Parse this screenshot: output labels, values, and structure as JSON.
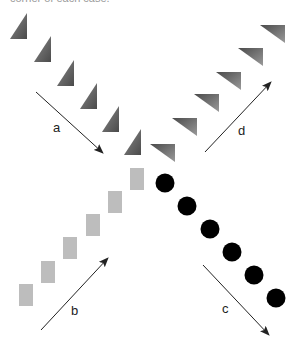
{
  "caption": "corner of each case.",
  "colors": {
    "triangle_fill_dark": "#555555",
    "triangle_fill_light": "#9a9a9a",
    "square_fill": "#bdbdbd",
    "circle_fill": "#000000",
    "arrow": "#222222"
  },
  "sequences": {
    "a": {
      "label": "a",
      "shape": "vertical-right-triangle",
      "direction": "down-right",
      "items": [
        {
          "x": 10,
          "y": 13
        },
        {
          "x": 34,
          "y": 36
        },
        {
          "x": 57,
          "y": 60
        },
        {
          "x": 80,
          "y": 83
        },
        {
          "x": 102,
          "y": 106
        },
        {
          "x": 124,
          "y": 129
        }
      ]
    },
    "d": {
      "label": "d",
      "shape": "horizontal-right-triangle",
      "direction": "up-right",
      "items": [
        {
          "x": 150,
          "y": 144
        },
        {
          "x": 172,
          "y": 118
        },
        {
          "x": 194,
          "y": 94
        },
        {
          "x": 216,
          "y": 72
        },
        {
          "x": 238,
          "y": 48
        },
        {
          "x": 260,
          "y": 25
        }
      ]
    },
    "b": {
      "label": "b",
      "shape": "square",
      "direction": "up-right",
      "items": [
        {
          "x": 19,
          "y": 284
        },
        {
          "x": 41,
          "y": 261
        },
        {
          "x": 63,
          "y": 237
        },
        {
          "x": 86,
          "y": 214
        },
        {
          "x": 108,
          "y": 191
        },
        {
          "x": 130,
          "y": 168
        }
      ]
    },
    "c": {
      "label": "c",
      "shape": "circle",
      "direction": "down-right",
      "items": [
        {
          "cx": 165,
          "cy": 183
        },
        {
          "cx": 187,
          "cy": 206
        },
        {
          "cx": 210,
          "cy": 229
        },
        {
          "cx": 232,
          "cy": 252
        },
        {
          "cx": 254,
          "cy": 275
        },
        {
          "cx": 276,
          "cy": 298
        }
      ]
    }
  },
  "arrows": [
    {
      "id": "a",
      "label": "a",
      "x1": 36,
      "y1": 92,
      "x2": 103,
      "y2": 153,
      "lx": 53,
      "ly": 132
    },
    {
      "id": "b",
      "label": "b",
      "x1": 41,
      "y1": 330,
      "x2": 108,
      "y2": 258,
      "lx": 71,
      "ly": 315
    },
    {
      "id": "c",
      "label": "c",
      "x1": 203,
      "y1": 265,
      "x2": 269,
      "y2": 335,
      "lx": 222,
      "ly": 313
    },
    {
      "id": "d",
      "label": "d",
      "x1": 205,
      "y1": 152,
      "x2": 271,
      "y2": 82,
      "lx": 238,
      "ly": 135
    }
  ]
}
